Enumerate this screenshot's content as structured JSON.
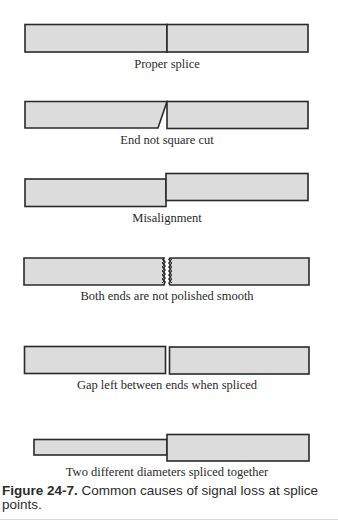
{
  "figure": {
    "number": "Figure 24-7.",
    "caption": "Common causes of signal loss at splice points.",
    "fill_color": "#dcdcdc",
    "stroke_color": "#2a2a2a"
  },
  "diagrams": [
    {
      "id": "proper-splice",
      "label": "Proper splice"
    },
    {
      "id": "end-not-square-cut",
      "label": "End not square cut"
    },
    {
      "id": "misalignment",
      "label": "Misalignment"
    },
    {
      "id": "ends-not-polished",
      "label": "Both ends are not polished smooth"
    },
    {
      "id": "gap-between-ends",
      "label": "Gap left between ends when spliced"
    },
    {
      "id": "different-diameters",
      "label": "Two different diameters spliced together"
    }
  ]
}
